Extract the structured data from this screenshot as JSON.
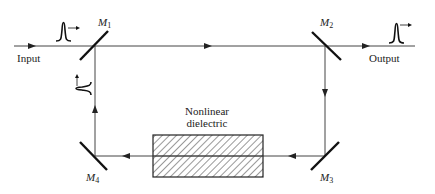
{
  "diagram": {
    "labels": {
      "input": "Input",
      "output": "Output",
      "medium_line1": "Nonlinear",
      "medium_line2": "dielectric"
    },
    "mirrors": [
      {
        "name": "M",
        "sub": "1"
      },
      {
        "name": "M",
        "sub": "2"
      },
      {
        "name": "M",
        "sub": "3"
      },
      {
        "name": "M",
        "sub": "4"
      }
    ],
    "colors": {
      "line": "#333333",
      "mirror": "#1a1a1a",
      "hatch": "#333333"
    }
  }
}
